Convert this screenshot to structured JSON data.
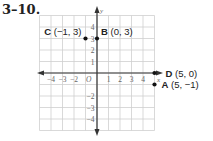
{
  "problem": {
    "number": "3–10."
  },
  "chart_data": {
    "type": "scatter",
    "title": "",
    "xlabel": "x",
    "ylabel": "y",
    "origin_label": "O",
    "xlim": [
      -5,
      5
    ],
    "ylim": [
      -5,
      5
    ],
    "grid": true,
    "x_ticks": [
      "−4",
      "−3",
      "−2",
      "1",
      "2",
      "3",
      "4"
    ],
    "y_ticks": [
      "4",
      "3",
      "2",
      "1",
      "−2",
      "−3",
      "−4"
    ],
    "points": [
      {
        "name": "A",
        "coords": "(5, −1)",
        "x": 5,
        "y": -1
      },
      {
        "name": "B",
        "coords": "(0, 3)",
        "x": 0,
        "y": 3
      },
      {
        "name": "C",
        "coords": "(−1, 3)",
        "x": -1,
        "y": 3
      },
      {
        "name": "D",
        "coords": "(5, 0)",
        "x": 5,
        "y": 0
      }
    ]
  },
  "colors": {
    "grid": "#cfcfcf",
    "axis": "#333333",
    "point": "#111111",
    "text": "#222222"
  }
}
